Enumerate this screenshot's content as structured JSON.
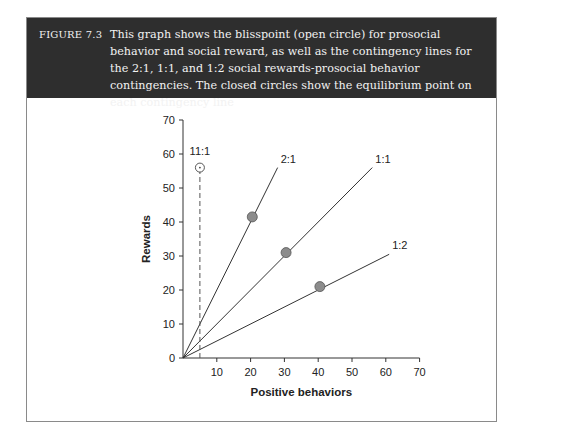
{
  "figure": {
    "label": "FIGURE 7.3",
    "caption": "This graph shows the blisspoint (open circle) for prosocial behavior and social reward, as well as the contingency lines for the 2:1, 1:1, and 1:2 social rewards-prosocial behavior contingencies. The closed circles show the equilibrium point on each contingency line"
  },
  "chart_data": {
    "type": "line",
    "title": "",
    "xlabel": "Positive behaviors",
    "ylabel": "Rewards",
    "xlim": [
      0,
      70
    ],
    "ylim": [
      0,
      70
    ],
    "x_ticks": [
      10,
      20,
      30,
      40,
      50,
      60,
      70
    ],
    "y_ticks": [
      0,
      10,
      20,
      30,
      40,
      50,
      60,
      70
    ],
    "grid": false,
    "series": [
      {
        "name": "2:1",
        "type": "line",
        "x": [
          0,
          28
        ],
        "y": [
          0,
          56
        ],
        "equilibrium": {
          "x": 20.5,
          "y": 41.5
        }
      },
      {
        "name": "1:1",
        "type": "line",
        "x": [
          0,
          56
        ],
        "y": [
          0,
          56
        ],
        "equilibrium": {
          "x": 30.5,
          "y": 31
        }
      },
      {
        "name": "1:2",
        "type": "line",
        "x": [
          0,
          61
        ],
        "y": [
          0,
          30.5
        ],
        "equilibrium": {
          "x": 40.5,
          "y": 21
        }
      },
      {
        "name": "11:1",
        "type": "dashed-line",
        "x": [
          5,
          5
        ],
        "y": [
          0,
          55
        ]
      }
    ],
    "blisspoint": {
      "label": "11:1",
      "x": 5,
      "y": 56,
      "marker": "open-circle"
    },
    "equilibrium_marker": "closed-circle",
    "colors": {
      "line": "#333333",
      "closed_circle": "#8c8c8c",
      "header_bg": "#2e2e2e"
    }
  }
}
